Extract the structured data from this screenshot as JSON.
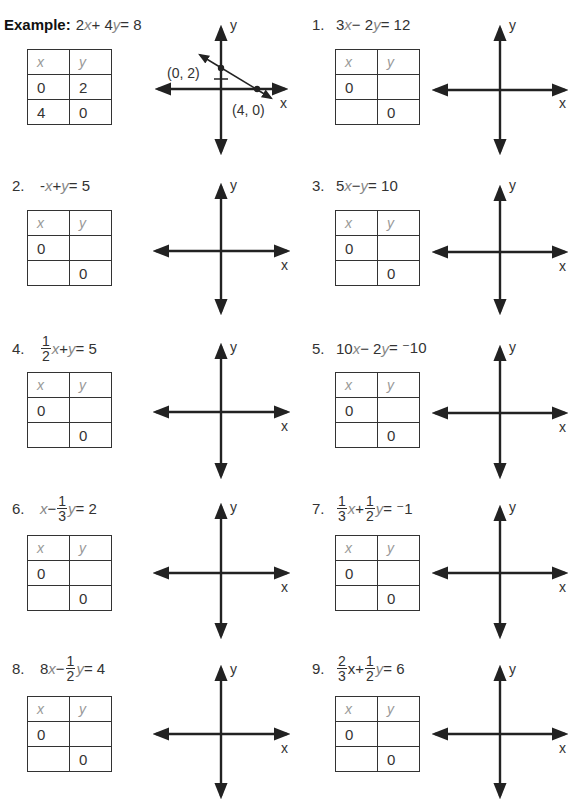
{
  "example": {
    "label": "Example:",
    "equation": {
      "parts": [
        "2",
        "x",
        " + 4",
        "y",
        " = 8"
      ]
    },
    "table": {
      "headers": [
        "x",
        "y"
      ],
      "rows": [
        [
          "0",
          "2"
        ],
        [
          "4",
          "0"
        ]
      ]
    },
    "graph": {
      "x_label": "x",
      "y_label": "y",
      "points": [
        {
          "label": "(0, 2)",
          "x": 0,
          "y": 2
        },
        {
          "label": "(4, 0)",
          "x": 4,
          "y": 0
        }
      ]
    }
  },
  "problems": [
    {
      "number": "1.",
      "equation_text": "3x − 2y = 12",
      "table": {
        "headers": [
          "x",
          "y"
        ],
        "rows": [
          [
            "0",
            ""
          ],
          [
            "",
            "0"
          ]
        ]
      },
      "graph": {
        "x_label": "x",
        "y_label": "y"
      }
    },
    {
      "number": "2.",
      "equation_text": "-x + y = 5",
      "table": {
        "headers": [
          "x",
          "y"
        ],
        "rows": [
          [
            "0",
            ""
          ],
          [
            "",
            "0"
          ]
        ]
      },
      "graph": {
        "x_label": "x",
        "y_label": "y"
      }
    },
    {
      "number": "3.",
      "equation_text": "5x − y = 10",
      "table": {
        "headers": [
          "x",
          "y"
        ],
        "rows": [
          [
            "0",
            ""
          ],
          [
            "",
            "0"
          ]
        ]
      },
      "graph": {
        "x_label": "x",
        "y_label": "y"
      }
    },
    {
      "number": "4.",
      "equation_text": "1/2 x + y = 5",
      "table": {
        "headers": [
          "x",
          "y"
        ],
        "rows": [
          [
            "0",
            ""
          ],
          [
            "",
            "0"
          ]
        ]
      },
      "graph": {
        "x_label": "x",
        "y_label": "y"
      }
    },
    {
      "number": "5.",
      "equation_text": "10x − 2y = ⁻10",
      "table": {
        "headers": [
          "x",
          "y"
        ],
        "rows": [
          [
            "0",
            ""
          ],
          [
            "",
            "0"
          ]
        ]
      },
      "graph": {
        "x_label": "x",
        "y_label": "y"
      }
    },
    {
      "number": "6.",
      "equation_text": "x − 1/3 y = 2",
      "table": {
        "headers": [
          "x",
          "y"
        ],
        "rows": [
          [
            "0",
            ""
          ],
          [
            "",
            "0"
          ]
        ]
      },
      "graph": {
        "x_label": "x",
        "y_label": "y"
      }
    },
    {
      "number": "7.",
      "equation_text": "1/3 x + 1/2 y = ⁻1",
      "table": {
        "headers": [
          "x",
          "y"
        ],
        "rows": [
          [
            "0",
            ""
          ],
          [
            "",
            "0"
          ]
        ]
      },
      "graph": {
        "x_label": "x",
        "y_label": "y"
      }
    },
    {
      "number": "8.",
      "equation_text": "8x − 1/2 y = 4",
      "table": {
        "headers": [
          "x",
          "y"
        ],
        "rows": [
          [
            "0",
            ""
          ],
          [
            "",
            "0"
          ]
        ]
      },
      "graph": {
        "x_label": "x",
        "y_label": "y"
      }
    },
    {
      "number": "9.",
      "equation_text": "2/3 x + 1/2 y = 6",
      "table": {
        "headers": [
          "x",
          "y"
        ],
        "rows": [
          [
            "0",
            ""
          ],
          [
            "",
            "0"
          ]
        ]
      },
      "graph": {
        "x_label": "x",
        "y_label": "y"
      }
    }
  ],
  "eq_tokens": {
    "p1": {
      "a": "3",
      "b": " − 2",
      "c": " = 12"
    },
    "p2": {
      "a": "-",
      "b": " + ",
      "c": " = 5"
    },
    "p3": {
      "a": "5",
      "b": " − ",
      "c": " = 10"
    },
    "p4": {
      "fn": "1",
      "fd": "2",
      "b": " + ",
      "c": " = 5"
    },
    "p5": {
      "a": "10",
      "b": " − 2",
      "c": " = ⁻10"
    },
    "p6": {
      "b": " − ",
      "fn": "1",
      "fd": "3",
      "c": " = 2"
    },
    "p7": {
      "f1n": "1",
      "f1d": "3",
      "b": " + ",
      "f2n": "1",
      "f2d": "2",
      "c": " = ⁻1"
    },
    "p8": {
      "a": "8",
      "b": " − ",
      "fn": "1",
      "fd": "2",
      "c": " = 4"
    },
    "p9": {
      "f1n": "2",
      "f1d": "3",
      "xv": "x",
      "b": " + ",
      "f2n": "1",
      "f2d": "2",
      "c": " = 6"
    }
  },
  "vars": {
    "x": "x",
    "y": "y"
  }
}
